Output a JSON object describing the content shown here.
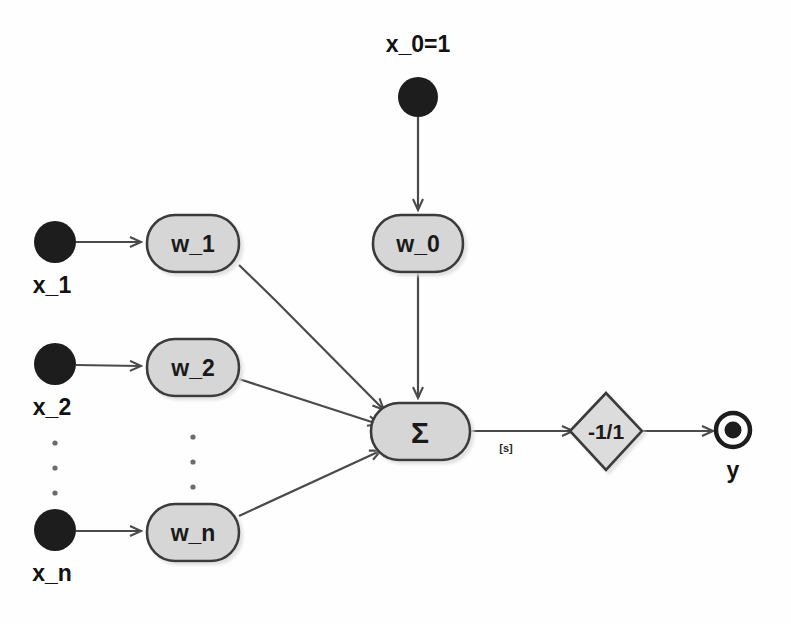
{
  "diagram": {
    "colors": {
      "input_node_fill": "#1d1d1d",
      "weight_node_fill": "#d6d6d6",
      "weight_node_stroke": "#3a3a3a",
      "edge_stroke": "#4a4a4a",
      "text": "#121212",
      "background": "#fefefe",
      "shadow": "#b9b9b9"
    },
    "bias": {
      "input_label": "x_0=1",
      "weight_label": "w_0"
    },
    "inputs": [
      {
        "label": "x_1",
        "weight_label": "w_1"
      },
      {
        "label": "x_2",
        "weight_label": "w_2"
      },
      {
        "label": "x_n",
        "weight_label": "w_n"
      }
    ],
    "ellipsis": {
      "glyph": "·",
      "count": 3
    },
    "summation": {
      "label": "Σ"
    },
    "activation": {
      "label": "-1/1",
      "edge_label": "[s]"
    },
    "output": {
      "label": "y"
    }
  }
}
